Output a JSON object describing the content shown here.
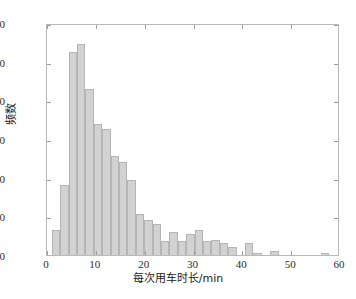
{
  "chart_data": {
    "type": "bar",
    "title": "",
    "xlabel": "每次用车时长/min",
    "ylabel": "频数",
    "xlim": [
      0,
      60
    ],
    "ylim": [
      0,
      120
    ],
    "xticks": [
      0,
      10,
      20,
      30,
      40,
      50,
      60
    ],
    "yticks": [
      0,
      20,
      40,
      60,
      80,
      100,
      120
    ],
    "grid": false,
    "legend": null,
    "bin_width": 1.72,
    "bin_start": 1.0,
    "bar_color": "#d2d2d2",
    "bar_edge_color": "#b5b5b5",
    "bin_centers": [
      1.86,
      3.58,
      5.3,
      7.02,
      8.74,
      10.46,
      12.18,
      13.9,
      15.62,
      17.34,
      19.06,
      20.78,
      22.5,
      24.22,
      25.94,
      27.66,
      29.38,
      31.1,
      32.82,
      34.54,
      36.26,
      37.98,
      39.7,
      41.42,
      43.14,
      44.86,
      46.58,
      48.3,
      50.02,
      51.74,
      53.46,
      55.18,
      56.9,
      58.62
    ],
    "bin_edges": [
      1.0,
      2.72,
      4.44,
      6.16,
      7.88,
      9.6,
      11.32,
      13.04,
      14.76,
      16.48,
      18.2,
      19.92,
      21.64,
      23.36,
      25.08,
      26.8,
      28.52,
      30.24,
      31.96,
      33.68,
      35.4,
      37.12,
      38.84,
      40.56,
      42.28,
      44.0,
      45.72,
      47.44,
      49.16,
      50.88,
      52.6,
      54.32,
      56.04,
      57.76,
      59.48
    ],
    "values": [
      13,
      36,
      105,
      109,
      86,
      68,
      65,
      51,
      48,
      39,
      21,
      18,
      16,
      7,
      12,
      7,
      11,
      13,
      7,
      8,
      6,
      4,
      0,
      6,
      1,
      0,
      2,
      0,
      0,
      0,
      0,
      0,
      1
    ],
    "categories": [
      "1.0-2.7",
      "2.7-4.4",
      "4.4-6.2",
      "6.2-7.9",
      "7.9-9.6",
      "9.6-11.3",
      "11.3-13.0",
      "13.0-14.8",
      "14.8-16.5",
      "16.5-18.2",
      "18.2-19.9",
      "19.9-21.6",
      "21.6-23.4",
      "23.4-25.1",
      "25.1-26.8",
      "26.8-28.5",
      "28.5-30.2",
      "30.2-32.0",
      "32.0-33.7",
      "33.7-35.4",
      "35.4-37.1",
      "37.1-38.8",
      "38.8-40.6",
      "40.6-42.3",
      "42.3-44.0",
      "44.0-45.7",
      "45.7-47.4",
      "47.4-49.2",
      "49.2-50.9",
      "50.9-52.6",
      "52.6-54.3",
      "54.3-56.0",
      "56.0-57.8"
    ]
  },
  "axes": {
    "x_tick_labels": [
      "0",
      "10",
      "20",
      "30",
      "40",
      "50",
      "60"
    ],
    "y_tick_labels": [
      "0",
      "20",
      "40",
      "60",
      "80",
      "100",
      "120"
    ]
  },
  "top_artifact": ""
}
